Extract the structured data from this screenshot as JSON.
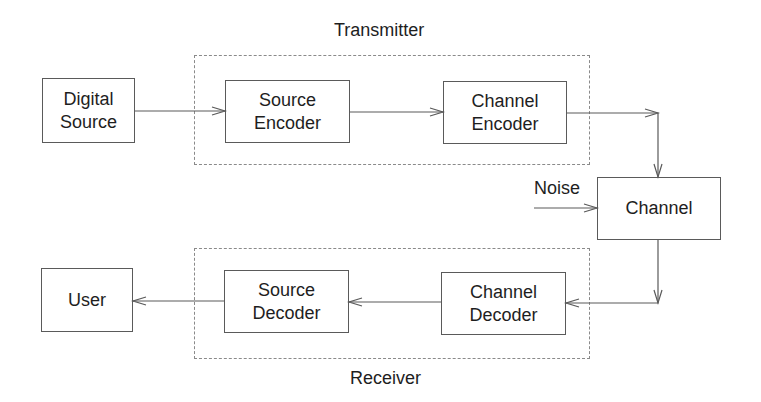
{
  "diagram": {
    "type": "block-diagram",
    "groups": {
      "transmitter": {
        "label": "Transmitter"
      },
      "receiver": {
        "label": "Receiver"
      }
    },
    "blocks": {
      "digital_source": {
        "label": "Digital\nSource"
      },
      "source_encoder": {
        "label": "Source\nEncoder"
      },
      "channel_encoder": {
        "label": "Channel\nEncoder"
      },
      "channel": {
        "label": "Channel"
      },
      "channel_decoder": {
        "label": "Channel\nDecoder"
      },
      "source_decoder": {
        "label": "Source\nDecoder"
      },
      "user": {
        "label": "User"
      }
    },
    "inputs": {
      "noise": {
        "label": "Noise"
      }
    },
    "edges": [
      {
        "from": "Digital Source",
        "to": "Source Encoder"
      },
      {
        "from": "Source Encoder",
        "to": "Channel Encoder"
      },
      {
        "from": "Channel Encoder",
        "to": "Channel"
      },
      {
        "from": "Noise",
        "to": "Channel"
      },
      {
        "from": "Channel",
        "to": "Channel Decoder"
      },
      {
        "from": "Channel Decoder",
        "to": "Source Decoder"
      },
      {
        "from": "Source Decoder",
        "to": "User"
      }
    ],
    "colors": {
      "line": "#5a5a5a",
      "dashed_border": "#8a8a8a",
      "text": "#1e1e1e",
      "background": "#ffffff"
    }
  }
}
